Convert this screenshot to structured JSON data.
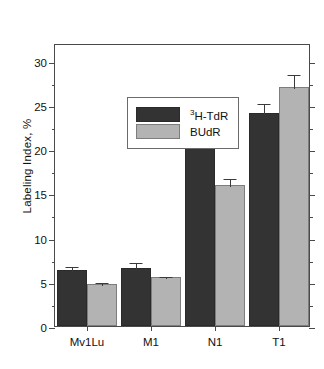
{
  "chart_data": {
    "type": "bar",
    "title": "",
    "xlabel": "",
    "ylabel": "Labeling Index, %",
    "categories": [
      "Mv1Lu",
      "M1",
      "N1",
      "T1"
    ],
    "ylim": [
      0,
      32
    ],
    "yticks": [
      0,
      5,
      10,
      15,
      20,
      25,
      30
    ],
    "ytick_labels": [
      "0",
      "5",
      "10",
      "15",
      "20",
      "25",
      "30"
    ],
    "minor_ticks": true,
    "grid": false,
    "legend_position": "upper left",
    "series": [
      {
        "name": "3H-TdR",
        "name_prefix_superscript": "3",
        "name_rest": "H-TdR",
        "color": "#333333",
        "values": [
          6.3,
          6.6,
          22.3,
          24.1
        ],
        "errors": [
          0.6,
          0.8,
          0.2,
          1.2
        ]
      },
      {
        "name": "BUdR",
        "name_prefix_superscript": "",
        "name_rest": "BUdR",
        "color": "#b3b3b3",
        "values": [
          4.7,
          5.5,
          15.9,
          27.0
        ],
        "errors": [
          0.35,
          0.25,
          0.9,
          1.6
        ]
      }
    ]
  },
  "axis": {
    "frame_color": "#4a4a4a",
    "text_color": "#111111"
  }
}
